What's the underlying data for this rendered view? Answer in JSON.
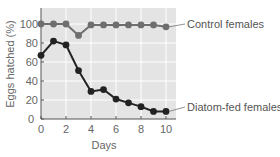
{
  "chart_data": {
    "type": "line",
    "title": "",
    "xlabel": "Days",
    "ylabel": "Eggs hatched (%)",
    "xlim": [
      0,
      10.8
    ],
    "ylim": [
      0,
      115
    ],
    "x_ticks": [
      0,
      2,
      4,
      6,
      8,
      10
    ],
    "y_ticks": [
      0,
      20,
      40,
      60,
      80,
      100
    ],
    "grid": true,
    "legend_position": "inline-right",
    "x": [
      0,
      1,
      2,
      3,
      4,
      5,
      6,
      7,
      8,
      9,
      10
    ],
    "series": [
      {
        "name": "Control females",
        "color": "#6e6e6e",
        "values": [
          100,
          100,
          100,
          88,
          99,
          99,
          99,
          99,
          99,
          99,
          97
        ]
      },
      {
        "name": "Diatom-fed females",
        "color": "#222222",
        "values": [
          67,
          82,
          78,
          51,
          29,
          31,
          21,
          17,
          13,
          8,
          8
        ]
      }
    ]
  },
  "colors": {
    "plot_background": "#e4e4e4",
    "gridline": "#ffffff",
    "axis": "#555555"
  }
}
